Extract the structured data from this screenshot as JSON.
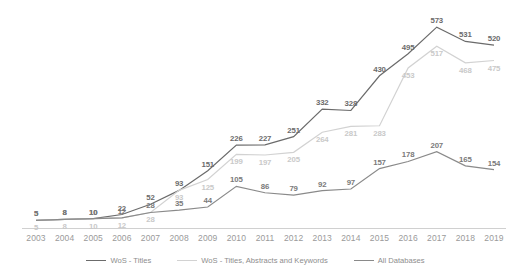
{
  "chart_data": {
    "type": "line",
    "title": "",
    "xlabel": "",
    "ylabel": "",
    "grid": false,
    "legend_position": "bottom",
    "categories": [
      "2003",
      "2004",
      "2005",
      "2006",
      "2007",
      "2008",
      "2009",
      "2010",
      "2011",
      "2012",
      "2013",
      "2014",
      "2015",
      "2016",
      "2017",
      "2018",
      "2019"
    ],
    "xlim": [
      2003,
      2019
    ],
    "ylim": [
      0,
      600
    ],
    "series": [
      {
        "name": "WoS - Titles",
        "color": "#6b6b6b",
        "values": [
          5,
          8,
          10,
          22,
          52,
          93,
          151,
          226,
          227,
          251,
          332,
          328,
          430,
          495,
          573,
          531,
          520
        ]
      },
      {
        "name": "WoS - Titles, Abstracts and Keywords",
        "color": "#d2d2d2",
        "values": [
          5,
          8,
          10,
          12,
          28,
          93,
          125,
          199,
          197,
          205,
          264,
          281,
          283,
          453,
          517,
          468,
          475
        ]
      },
      {
        "name": "All Databases",
        "color": "#8a8a8a",
        "values": [
          5,
          8,
          10,
          12,
          28,
          35,
          44,
          105,
          86,
          79,
          92,
          97,
          157,
          178,
          207,
          165,
          154
        ]
      }
    ]
  },
  "legend": {
    "items": [
      {
        "label": "WoS - Titles"
      },
      {
        "label": "WoS - Titles, Abstracts and Keywords"
      },
      {
        "label": "All Databases"
      }
    ]
  }
}
